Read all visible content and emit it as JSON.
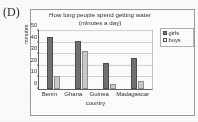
{
  "panel": {
    "label": "(D)"
  },
  "chart_data": {
    "type": "bar",
    "title": "How long people spend getting water (minutes a day)",
    "title_line1": "How long people spend getting water",
    "title_line2": "(minutes a day)",
    "xlabel": "country",
    "ylabel": "minutes",
    "categories": [
      "Benin",
      "Ghana",
      "Guinea",
      "Madagascar"
    ],
    "series": [
      {
        "name": "girls",
        "values": [
          45,
          41,
          22,
          27
        ],
        "color": "#6f6f6f"
      },
      {
        "name": "boys",
        "values": [
          11,
          33,
          4,
          7
        ],
        "color": "#cbcbc9"
      }
    ],
    "ylim": [
      0,
      50
    ],
    "yticks": [
      0,
      10,
      20,
      30,
      40,
      50
    ],
    "ytick_labels": [
      "0",
      "10",
      "20",
      "30",
      "40",
      "50"
    ],
    "grid": true,
    "legend_position": "right-outside"
  }
}
